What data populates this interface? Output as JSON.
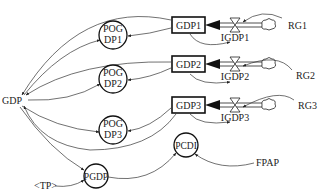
{
  "diagram": {
    "type": "system-dynamics-stock-flow",
    "stocks": [
      {
        "id": "gdp1",
        "label": "GDP1"
      },
      {
        "id": "gdp2",
        "label": "GDP2"
      },
      {
        "id": "gdp3",
        "label": "GDP3"
      }
    ],
    "flows": [
      {
        "id": "igdp1",
        "label": "IGDP1"
      },
      {
        "id": "igdp2",
        "label": "IGDP2"
      },
      {
        "id": "igdp3",
        "label": "IGDP3"
      }
    ],
    "rates": [
      {
        "id": "rg1",
        "label": "RG1"
      },
      {
        "id": "rg2",
        "label": "RG2"
      },
      {
        "id": "rg3",
        "label": "RG3"
      }
    ],
    "auxiliaries": {
      "pogdp1": {
        "line1": "POG",
        "line2": "DP1"
      },
      "pogdp2": {
        "line1": "POG",
        "line2": "DP2"
      },
      "pogdp3": {
        "line1": "POG",
        "line2": "DP3"
      },
      "pgdp": "PGDP",
      "pcdi": "PCDI"
    },
    "variables": {
      "gdp": "GDP",
      "fpap": "FPAP",
      "tp": "<TP>"
    }
  }
}
